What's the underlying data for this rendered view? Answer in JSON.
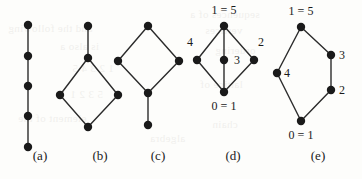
{
  "figure": {
    "name": "hasse-diagrams-figure",
    "background_color": "#fdfdfb",
    "node_color": "#1a1a1a",
    "edge_color": "#2b2b2b",
    "width": 362,
    "height": 179,
    "node_radius": 4.2,
    "edge_width": 1.4
  },
  "captions": [
    {
      "id": "a",
      "text": "(a)",
      "x": 40,
      "y": 160
    },
    {
      "id": "b",
      "text": "(b)",
      "x": 100,
      "y": 160
    },
    {
      "id": "c",
      "text": "(c)",
      "x": 158,
      "y": 160
    },
    {
      "id": "d",
      "text": "(d)",
      "x": 233,
      "y": 160
    },
    {
      "id": "e",
      "text": "(e)",
      "x": 318,
      "y": 160
    }
  ],
  "diagrams": [
    {
      "id": "a",
      "caption": "(a)",
      "description": "vertical chain of five elements",
      "nodes": [
        {
          "id": "a0",
          "x": 28,
          "y": 25,
          "label": ""
        },
        {
          "id": "a1",
          "x": 28,
          "y": 56,
          "label": ""
        },
        {
          "id": "a2",
          "x": 28,
          "y": 86,
          "label": ""
        },
        {
          "id": "a3",
          "x": 28,
          "y": 116,
          "label": ""
        },
        {
          "id": "a4",
          "x": 28,
          "y": 147,
          "label": ""
        }
      ],
      "edges": [
        {
          "from": "a0",
          "to": "a1"
        },
        {
          "from": "a1",
          "to": "a2"
        },
        {
          "from": "a2",
          "to": "a3"
        },
        {
          "from": "a3",
          "to": "a4"
        }
      ]
    },
    {
      "id": "b",
      "caption": "(b)",
      "description": "top pendant edge over a diamond",
      "nodes": [
        {
          "id": "b_top",
          "x": 88,
          "y": 26,
          "label": ""
        },
        {
          "id": "b_upper",
          "x": 88,
          "y": 58,
          "label": ""
        },
        {
          "id": "b_left",
          "x": 60,
          "y": 95,
          "label": ""
        },
        {
          "id": "b_right",
          "x": 118,
          "y": 95,
          "label": ""
        },
        {
          "id": "b_bottom",
          "x": 88,
          "y": 127,
          "label": ""
        }
      ],
      "edges": [
        {
          "from": "b_top",
          "to": "b_upper"
        },
        {
          "from": "b_upper",
          "to": "b_left"
        },
        {
          "from": "b_upper",
          "to": "b_right"
        },
        {
          "from": "b_left",
          "to": "b_bottom"
        },
        {
          "from": "b_right",
          "to": "b_bottom"
        }
      ]
    },
    {
      "id": "c",
      "caption": "(c)",
      "description": "diamond with a pendant edge below",
      "nodes": [
        {
          "id": "c_top",
          "x": 148,
          "y": 26,
          "label": ""
        },
        {
          "id": "c_left",
          "x": 118,
          "y": 61,
          "label": ""
        },
        {
          "id": "c_right",
          "x": 179,
          "y": 61,
          "label": ""
        },
        {
          "id": "c_lower",
          "x": 148,
          "y": 93,
          "label": ""
        },
        {
          "id": "c_bottom",
          "x": 148,
          "y": 125,
          "label": ""
        }
      ],
      "edges": [
        {
          "from": "c_top",
          "to": "c_left"
        },
        {
          "from": "c_top",
          "to": "c_right"
        },
        {
          "from": "c_left",
          "to": "c_lower"
        },
        {
          "from": "c_right",
          "to": "c_lower"
        },
        {
          "from": "c_lower",
          "to": "c_bottom"
        }
      ]
    },
    {
      "id": "d",
      "caption": "(d)",
      "description": "diamond with a central element, labelled poset",
      "nodes": [
        {
          "id": "d_top",
          "x": 224,
          "y": 26,
          "label": "1 = 5",
          "label_x": 224,
          "label_y": 14,
          "label_anchor": "middle"
        },
        {
          "id": "d_left",
          "x": 197,
          "y": 60,
          "label": "4",
          "label_x": 190,
          "label_y": 46,
          "label_anchor": "middle"
        },
        {
          "id": "d_center",
          "x": 224,
          "y": 60,
          "label": "3",
          "label_x": 234,
          "label_y": 64,
          "label_anchor": "start"
        },
        {
          "id": "d_right",
          "x": 254,
          "y": 60,
          "label": "2",
          "label_x": 261,
          "label_y": 46,
          "label_anchor": "middle"
        },
        {
          "id": "d_bottom",
          "x": 224,
          "y": 92,
          "label": "0 = 1",
          "label_x": 224,
          "label_y": 110,
          "label_anchor": "middle"
        }
      ],
      "edges": [
        {
          "from": "d_top",
          "to": "d_left"
        },
        {
          "from": "d_top",
          "to": "d_right"
        },
        {
          "from": "d_top",
          "to": "d_center"
        },
        {
          "from": "d_left",
          "to": "d_bottom"
        },
        {
          "from": "d_right",
          "to": "d_bottom"
        },
        {
          "from": "d_center",
          "to": "d_bottom"
        }
      ]
    },
    {
      "id": "e",
      "caption": "(e)",
      "description": "two chains between bottom and top, labelled poset",
      "nodes": [
        {
          "id": "e_top",
          "x": 301,
          "y": 27,
          "label": "1 = 5",
          "label_x": 301,
          "label_y": 15,
          "label_anchor": "middle"
        },
        {
          "id": "e_right1",
          "x": 331,
          "y": 55,
          "label": "3",
          "label_x": 339,
          "label_y": 59,
          "label_anchor": "start"
        },
        {
          "id": "e_left",
          "x": 277,
          "y": 73,
          "label": "4",
          "label_x": 284,
          "label_y": 77,
          "label_anchor": "start"
        },
        {
          "id": "e_right2",
          "x": 331,
          "y": 90,
          "label": "2",
          "label_x": 339,
          "label_y": 94,
          "label_anchor": "start"
        },
        {
          "id": "e_bottom",
          "x": 301,
          "y": 121,
          "label": "0 = 1",
          "label_x": 301,
          "label_y": 139,
          "label_anchor": "middle"
        }
      ],
      "edges": [
        {
          "from": "e_top",
          "to": "e_left"
        },
        {
          "from": "e_top",
          "to": "e_right1"
        },
        {
          "from": "e_right1",
          "to": "e_right2"
        },
        {
          "from": "e_right2",
          "to": "e_bottom"
        },
        {
          "from": "e_left",
          "to": "e_bottom"
        }
      ]
    }
  ],
  "label_font_size": 12,
  "caption_font_size": 13
}
